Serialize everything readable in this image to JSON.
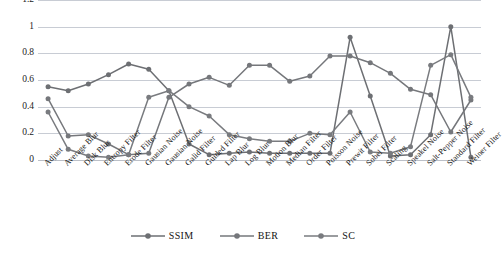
{
  "chart_data": {
    "type": "line",
    "title": "",
    "xlabel": "",
    "ylabel": "",
    "ylim": [
      0,
      1.2
    ],
    "ytick_values": [
      0,
      0.2,
      0.4,
      0.6,
      0.8,
      1,
      1.2
    ],
    "ytick_labels": [
      "0",
      "0.2",
      "0.4",
      "0.6",
      "0.8",
      "1",
      "1.2"
    ],
    "grid": true,
    "legend_position": "bottom",
    "categories": [
      "Adjust",
      "Average Blur",
      "Disk Blur",
      "Entropy Filter",
      "Erode Filter",
      "Gausian Noise",
      "Gausian Noise",
      "Galid Filter",
      "Guided Filter",
      "Lap Blur",
      "Log Blur",
      "Motion Blur",
      "Median Filter",
      "Order Filter",
      "Poisson Noise",
      "Prewit Filter",
      "Sobel Filter",
      "Scaling",
      "Speakel Noise",
      "Salt-Pepper Noise",
      "Standard Filter",
      "Weiner Filter"
    ],
    "series": [
      {
        "name": "SSIM",
        "color": "#6d6f73",
        "values": [
          0.55,
          0.52,
          0.57,
          0.64,
          0.72,
          0.68,
          0.52,
          0.12,
          0.04,
          0.05,
          0.06,
          0.05,
          0.05,
          0.05,
          0.05,
          0.92,
          0.48,
          0.03,
          0.04,
          0.19,
          1.0,
          0.02
        ]
      },
      {
        "name": "BER",
        "color": "#75777b",
        "values": [
          0.46,
          0.18,
          0.19,
          0.12,
          0.04,
          0.05,
          0.47,
          0.57,
          0.62,
          0.56,
          0.71,
          0.71,
          0.59,
          0.63,
          0.78,
          0.78,
          0.73,
          0.65,
          0.53,
          0.49,
          0.21,
          0.45
        ]
      },
      {
        "name": "SC",
        "color": "#797b7f",
        "values": [
          0.36,
          0.08,
          0.03,
          0.02,
          0.04,
          0.47,
          0.52,
          0.4,
          0.33,
          0.19,
          0.16,
          0.14,
          0.14,
          0.2,
          0.19,
          0.36,
          0.06,
          0.05,
          0.1,
          0.71,
          0.79,
          0.47
        ]
      }
    ],
    "legend": [
      {
        "label": "SSIM",
        "color": "#6d6f73"
      },
      {
        "label": "BER",
        "color": "#75777b"
      },
      {
        "label": "SC",
        "color": "#797b7f"
      }
    ]
  },
  "colors": {
    "gridline": "#c8ccd4",
    "text": "#161616",
    "background": "#ffffff"
  }
}
